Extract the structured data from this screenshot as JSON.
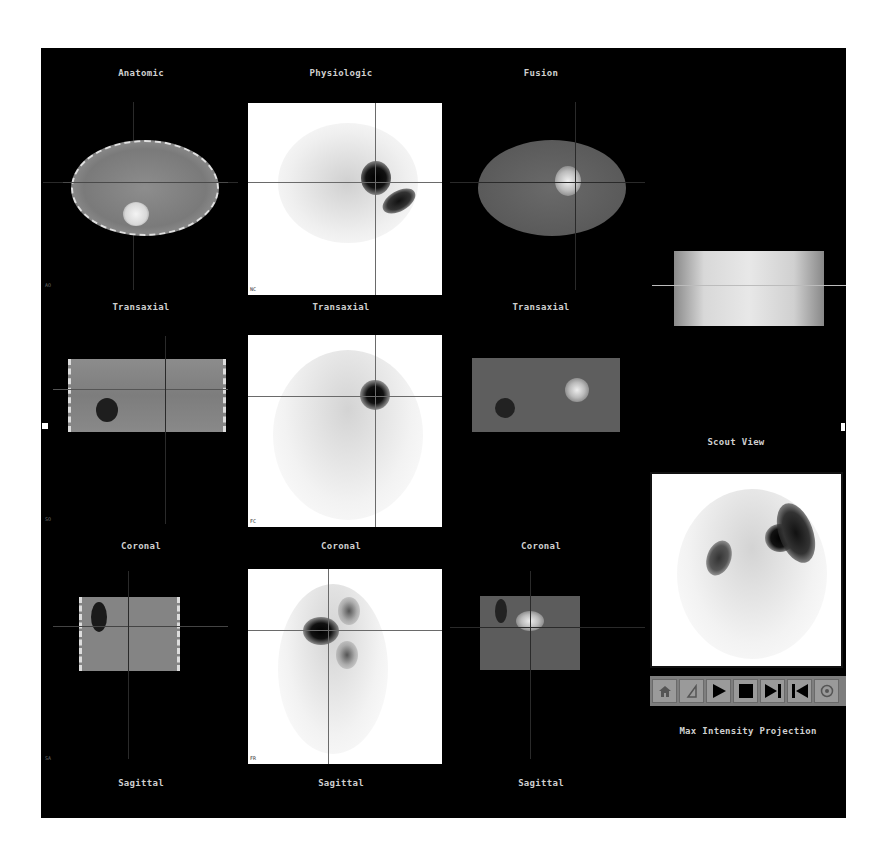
{
  "columns": {
    "anatomic": "Anatomic",
    "physiologic": "Physiologic",
    "fusion": "Fusion"
  },
  "rows": {
    "transaxial": "Transaxial",
    "coronal": "Coronal",
    "sagittal": "Sagittal"
  },
  "scout": {
    "label": "Scout View"
  },
  "mip": {
    "label": "Max Intensity Projection"
  },
  "corner_labels": {
    "row1_left": "AO",
    "row1_mid": "NC",
    "row2_left": "SO",
    "row2_mid": "FC",
    "row3_left": "SA",
    "row3_mid": "FR"
  },
  "toolbar": {
    "buttons": [
      {
        "icon": "home-icon",
        "label": "Home"
      },
      {
        "icon": "window-level-icon",
        "label": "Window/Level"
      },
      {
        "icon": "play-icon",
        "label": "Play"
      },
      {
        "icon": "stop-icon",
        "label": "Stop"
      },
      {
        "icon": "step-forward-icon",
        "label": "Step Forward"
      },
      {
        "icon": "step-back-icon",
        "label": "Step Back"
      },
      {
        "icon": "settings-icon",
        "label": "Settings"
      }
    ]
  },
  "colors": {
    "background": "#000000",
    "label_text": "#cfcfcf",
    "pet_background": "#ffffff",
    "toolbar": "#7e7e7e"
  }
}
